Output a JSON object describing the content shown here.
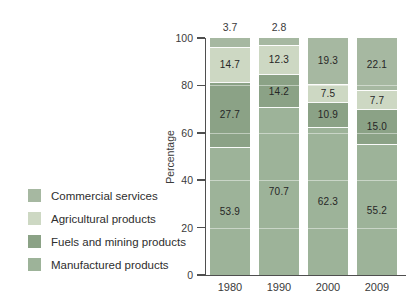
{
  "figure": {
    "ylabel": "Percentage"
  },
  "legend": {
    "items": [
      {
        "label": "Commercial services",
        "color": "#a6b8a1"
      },
      {
        "label": "Agricultural products",
        "color": "#cdd8c3"
      },
      {
        "label": "Fuels and mining products",
        "color": "#8ba286"
      },
      {
        "label": "Manufactured products",
        "color": "#9db399"
      }
    ]
  },
  "chart_data": {
    "type": "bar",
    "subtype": "stacked-percentage",
    "title": "",
    "xlabel": "",
    "ylabel": "Percentage",
    "ylim": [
      0,
      100
    ],
    "yticks": [
      0,
      20,
      40,
      60,
      80,
      100
    ],
    "categories": [
      "1980",
      "1990",
      "2000",
      "2009"
    ],
    "series": [
      {
        "name": "Manufactured products",
        "color": "#9db399",
        "values": [
          53.9,
          70.7,
          62.3,
          55.2
        ]
      },
      {
        "name": "Fuels and mining products",
        "color": "#8ba286",
        "values": [
          27.7,
          14.2,
          10.9,
          15.0
        ]
      },
      {
        "name": "Agricultural products",
        "color": "#cdd8c3",
        "values": [
          14.7,
          12.3,
          7.5,
          7.7
        ]
      },
      {
        "name": "Commercial services",
        "color": "#a6b8a1",
        "values": [
          3.7,
          2.8,
          19.3,
          22.1
        ]
      }
    ],
    "stack_order_bottom_to_top": [
      "Manufactured products",
      "Fuels and mining products",
      "Agricultural products",
      "Commercial services"
    ],
    "value_label_format": "one-decimal",
    "small_segment_label_placement": "above-bar-when-under-5-percent",
    "grid": "faint white horizontal lines at 20/40/60/80 drawn over bars",
    "legend_position": "left"
  }
}
